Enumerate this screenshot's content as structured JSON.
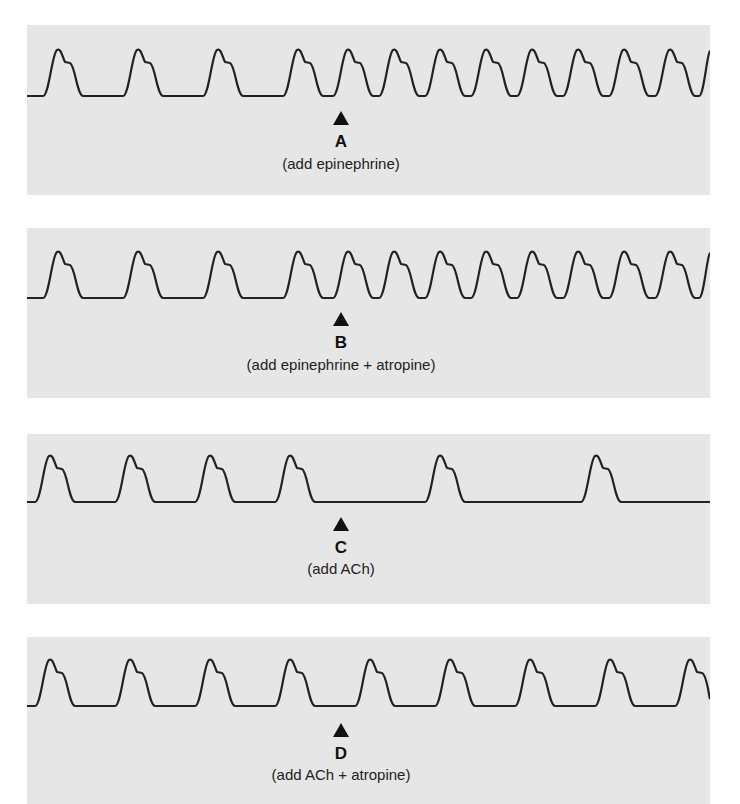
{
  "panels": [
    {
      "id": "A",
      "letter": "A",
      "caption": "(add epinephrine)",
      "effect": "heart rate increases after addition"
    },
    {
      "id": "B",
      "letter": "B",
      "caption": "(add epinephrine + atropine)",
      "effect": "heart rate increases after addition"
    },
    {
      "id": "C",
      "letter": "C",
      "caption": "(add ACh)",
      "effect": "heart rate decreases after addition"
    },
    {
      "id": "D",
      "letter": "D",
      "caption": "(add ACh + atropine)",
      "effect": "heart rate unchanged"
    }
  ],
  "colors": {
    "panel_bg": "#e6e6e6",
    "trace": "#222222",
    "marker": "#111111"
  }
}
